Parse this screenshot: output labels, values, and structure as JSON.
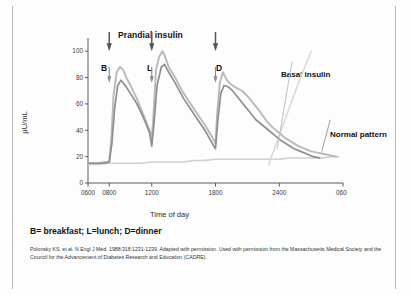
{
  "figure": {
    "annotation_title": "Prandial insulin",
    "footnote": "B= breakfast; L=lunch; D=dinner",
    "citation": "Polonsky KS, et al. N Engl J Med. 1988;318:1231-1239. Adapted with permission. Used with permission from the Massachusetts Medical Society and the Council for the Advancement of Diabetes Research and Education (CADRE).",
    "meal_markers": [
      {
        "letter": "B",
        "name": "breakfast",
        "time": "0800"
      },
      {
        "letter": "L",
        "name": "lunch",
        "time": "1200"
      },
      {
        "letter": "D",
        "name": "dinner",
        "time": "1800"
      }
    ],
    "callouts": [
      {
        "name": "basal-insulin",
        "label": "Basal insulin"
      },
      {
        "name": "normal-pattern",
        "label": "Normal pattern"
      }
    ],
    "colors": {
      "light_curve": "#b9b9b9",
      "dark_curve": "#8f8f8f",
      "normal_pattern": "#cfcfcf",
      "basal_insulin": "#d5d5d5",
      "axis": "#5a5a5a",
      "text": "#101010"
    }
  },
  "chart_data": {
    "type": "line",
    "title": "Prandial insulin",
    "xlabel": "Time of day",
    "ylabel": "µU/mL",
    "xlim": [
      600,
      3000
    ],
    "ylim": [
      0,
      110
    ],
    "grid": false,
    "legend_position": "inline-callouts",
    "xticks": [
      600,
      800,
      1200,
      1800,
      2400,
      3000
    ],
    "xticklabels": [
      "0600",
      "0800",
      "1200",
      "1800",
      "2400",
      "0600"
    ],
    "yticks": [
      0,
      20,
      40,
      60,
      80,
      100
    ],
    "yticklabels": [
      "0",
      "20",
      "40",
      "60",
      "80",
      "100"
    ],
    "annotations": [
      {
        "text": "Prandial insulin",
        "x": 1300,
        "y": 118
      },
      {
        "text": "B",
        "x": 800,
        "y": 92
      },
      {
        "text": "L",
        "x": 1200,
        "y": 92
      },
      {
        "text": "D",
        "x": 1800,
        "y": 92
      },
      {
        "text": "Basal insulin",
        "x": 2500,
        "y": 88
      },
      {
        "text": "Normal pattern",
        "x": 2850,
        "y": 45
      }
    ],
    "series": [
      {
        "name": "Insulin profile (lighter, higher peaks)",
        "color": "#b9b9b9",
        "x": [
          600,
          700,
          760,
          800,
          820,
          840,
          870,
          900,
          930,
          960,
          1000,
          1060,
          1120,
          1180,
          1200,
          1215,
          1240,
          1270,
          1300,
          1320,
          1360,
          1420,
          1500,
          1600,
          1700,
          1760,
          1800,
          1815,
          1840,
          1870,
          1900,
          1930,
          1960,
          2000,
          2050,
          2100,
          2160,
          2220,
          2280,
          2340,
          2400,
          2460,
          2520,
          2580,
          2640,
          2700,
          2760,
          2820,
          2880,
          2940
        ],
        "y": [
          15,
          15,
          16,
          16,
          34,
          66,
          84,
          88,
          86,
          80,
          74,
          64,
          52,
          40,
          34,
          50,
          86,
          96,
          100,
          97,
          88,
          80,
          68,
          56,
          44,
          36,
          30,
          52,
          76,
          84,
          79,
          76,
          74,
          72,
          70,
          66,
          60,
          54,
          47,
          42,
          38,
          34,
          31,
          28,
          26,
          24,
          23,
          22,
          21,
          20
        ]
      },
      {
        "name": "Insulin profile (darker, lower peaks)",
        "color": "#8f8f8f",
        "x": [
          600,
          700,
          760,
          800,
          825,
          850,
          880,
          910,
          950,
          1000,
          1060,
          1120,
          1180,
          1200,
          1220,
          1250,
          1290,
          1320,
          1360,
          1420,
          1500,
          1600,
          1700,
          1770,
          1800,
          1820,
          1850,
          1880,
          1920,
          1960,
          2000,
          2060,
          2120,
          2180,
          2240,
          2300,
          2360,
          2420,
          2480,
          2540,
          2600,
          2660,
          2720,
          2780
        ],
        "y": [
          15,
          15,
          15,
          16,
          30,
          56,
          74,
          78,
          74,
          68,
          60,
          50,
          38,
          28,
          44,
          74,
          88,
          90,
          84,
          76,
          64,
          52,
          40,
          30,
          26,
          46,
          68,
          74,
          73,
          70,
          66,
          60,
          54,
          48,
          44,
          40,
          36,
          32,
          29,
          26,
          24,
          22,
          20,
          19
        ]
      },
      {
        "name": "Normal pattern",
        "color": "#cfcfcf",
        "x": [
          600,
          700,
          800,
          900,
          1000,
          1100,
          1200,
          1300,
          1400,
          1500,
          1600,
          1700,
          1800,
          1900,
          2000,
          2100,
          2200,
          2300,
          2400,
          2500,
          2600,
          2700,
          2800,
          2900,
          2960
        ],
        "y": [
          14,
          14,
          15,
          15,
          15,
          15,
          16,
          16,
          16,
          16,
          17,
          17,
          18,
          18,
          18,
          18,
          18,
          18,
          18,
          19,
          19,
          19,
          19,
          20,
          20
        ]
      },
      {
        "name": "Basal insulin",
        "color": "#d9d9d9",
        "x": [
          2300,
          2400,
          2500,
          2600,
          2700
        ],
        "y": [
          14,
          36,
          58,
          80,
          100
        ]
      }
    ]
  }
}
